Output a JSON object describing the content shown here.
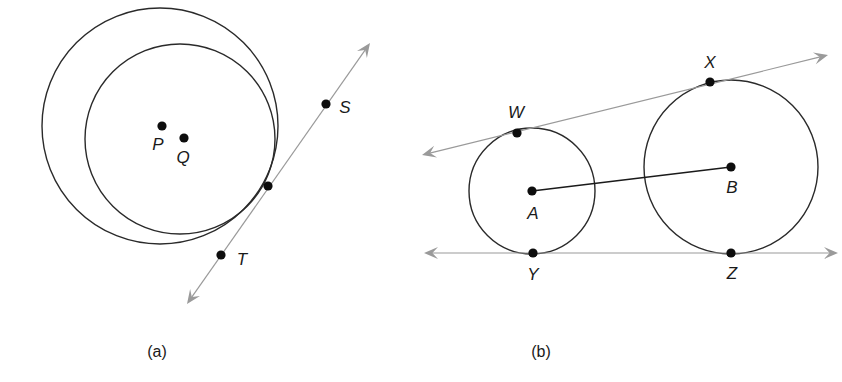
{
  "figure": {
    "panels": [
      {
        "id": "a",
        "caption": "(a)",
        "caption_pos": [
          157,
          357
        ],
        "circles": [
          {
            "name": "outer-circle-P",
            "cx": 160,
            "cy": 126,
            "r": 118
          },
          {
            "name": "inner-circle-Q",
            "cx": 180,
            "cy": 139,
            "r": 95
          }
        ],
        "lines": [
          {
            "name": "tangent-line-ST",
            "x1": 187,
            "y1": 304,
            "x2": 370,
            "y2": 43
          }
        ],
        "points": [
          {
            "label": "P",
            "x": 162,
            "y": 126,
            "lx": 158,
            "ly": 150
          },
          {
            "label": "Q",
            "x": 184,
            "y": 138,
            "lx": 183,
            "ly": 163
          },
          {
            "label": "",
            "x": 268,
            "y": 186,
            "lx": 0,
            "ly": 0
          },
          {
            "label": "S",
            "x": 326,
            "y": 104,
            "lx": 345,
            "ly": 113
          },
          {
            "label": "T",
            "x": 221,
            "y": 255,
            "lx": 242,
            "ly": 265
          }
        ]
      },
      {
        "id": "b",
        "caption": "(b)",
        "caption_pos": [
          541,
          357
        ],
        "circles": [
          {
            "name": "circle-A",
            "cx": 532,
            "cy": 191,
            "r": 63
          },
          {
            "name": "circle-B",
            "cx": 731,
            "cy": 167,
            "r": 87
          }
        ],
        "segments": [
          {
            "name": "segment-AB",
            "x1": 532,
            "y1": 191,
            "x2": 731,
            "y2": 167
          }
        ],
        "lines": [
          {
            "name": "tangent-line-WX",
            "x1": 422,
            "y1": 155,
            "x2": 828,
            "y2": 55
          },
          {
            "name": "tangent-line-YZ",
            "x1": 424,
            "y1": 253,
            "x2": 838,
            "y2": 253
          }
        ],
        "points": [
          {
            "label": "W",
            "x": 517,
            "y": 133,
            "lx": 516,
            "ly": 118
          },
          {
            "label": "X",
            "x": 710,
            "y": 82,
            "lx": 710,
            "ly": 68
          },
          {
            "label": "A",
            "x": 532,
            "y": 191,
            "lx": 533,
            "ly": 219
          },
          {
            "label": "B",
            "x": 731,
            "y": 167,
            "lx": 732,
            "ly": 193
          },
          {
            "label": "Y",
            "x": 533,
            "y": 253,
            "lx": 533,
            "ly": 280
          },
          {
            "label": "Z",
            "x": 731,
            "y": 253,
            "lx": 732,
            "ly": 279
          }
        ]
      }
    ],
    "colors": {
      "stroke": "#2a2a2a",
      "line": "#9a9a9a",
      "dot": "#0d0d0d",
      "background": "#ffffff"
    }
  }
}
